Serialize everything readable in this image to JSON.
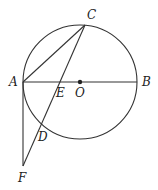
{
  "diagram": {
    "type": "geometry",
    "circle": {
      "center": "O",
      "cx": 80,
      "cy": 82,
      "r": 57
    },
    "points": {
      "A": {
        "label": "A",
        "x": 23,
        "y": 82,
        "lx": 10,
        "ly": 86
      },
      "B": {
        "label": "B",
        "x": 137,
        "y": 82,
        "lx": 142,
        "ly": 86
      },
      "C": {
        "label": "C",
        "x": 85,
        "y": 25,
        "lx": 87,
        "ly": 19
      },
      "O": {
        "label": "O",
        "x": 80,
        "y": 82,
        "lx": 75,
        "ly": 97
      },
      "E": {
        "label": "E",
        "x": 60,
        "y": 82,
        "lx": 57,
        "ly": 97
      },
      "D": {
        "label": "D",
        "x": 43,
        "y": 126,
        "lx": 38,
        "ly": 141
      },
      "F": {
        "label": "F",
        "x": 23,
        "y": 166,
        "lx": 18,
        "ly": 182
      }
    },
    "segments": [
      "AB",
      "AC",
      "CF",
      "AF"
    ]
  }
}
